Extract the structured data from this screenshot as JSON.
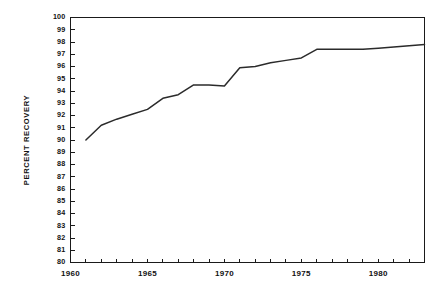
{
  "chart_data": {
    "type": "line",
    "title": "",
    "subtitle": "",
    "xlabel": "",
    "ylabel": "PERCENT RECOVERY",
    "xlim": [
      1960,
      1983
    ],
    "ylim": [
      80,
      100
    ],
    "grid": false,
    "legend": false,
    "legend_position": "none",
    "line_color": "#2b2b2b",
    "x_tick_labels": [
      "1960",
      "1965",
      "1970",
      "1975",
      "1980"
    ],
    "x_tick_label_values": [
      1960,
      1965,
      1970,
      1975,
      1980
    ],
    "x_minor_ticks": [
      1960,
      1961,
      1962,
      1963,
      1964,
      1965,
      1966,
      1967,
      1968,
      1969,
      1970,
      1971,
      1972,
      1973,
      1974,
      1975,
      1976,
      1977,
      1978,
      1979,
      1980,
      1981,
      1982,
      1983
    ],
    "y_tick_labels": [
      "100",
      "99",
      "98",
      "97",
      "96",
      "95",
      "94",
      "93",
      "92",
      "91",
      "90",
      "89",
      "88",
      "87",
      "86",
      "85",
      "84",
      "83",
      "82",
      "81",
      "80"
    ],
    "y_tick_values": [
      100,
      99,
      98,
      97,
      96,
      95,
      94,
      93,
      92,
      91,
      90,
      89,
      88,
      87,
      86,
      85,
      84,
      83,
      82,
      81,
      80
    ],
    "series": [
      {
        "name": "Percent Recovery",
        "x": [
          1961,
          1962,
          1963,
          1964,
          1965,
          1966,
          1967,
          1968,
          1969,
          1970,
          1971,
          1972,
          1973,
          1974,
          1975,
          1976,
          1977,
          1978,
          1979,
          1980,
          1981,
          1982,
          1983
        ],
        "values": [
          90.0,
          91.2,
          91.7,
          92.1,
          92.5,
          93.4,
          93.7,
          94.5,
          94.5,
          94.4,
          95.9,
          96.0,
          96.3,
          96.5,
          96.7,
          97.4,
          97.4,
          97.4,
          97.4,
          97.5,
          97.6,
          97.7,
          97.8
        ]
      }
    ]
  }
}
